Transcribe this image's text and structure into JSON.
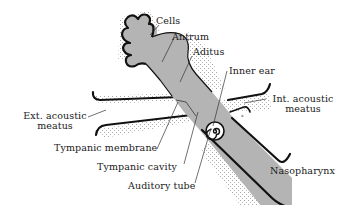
{
  "diagram": {
    "colors": {
      "tube_fill": "#b4b4b4",
      "outline": "#111111",
      "stipple": "#8a8a8a",
      "background": "#ffffff"
    },
    "labels": {
      "cells": "Cells",
      "antrum": "Antrum",
      "aditus": "Aditus",
      "inner_ear": "Inner ear",
      "int_acoustic_meatus_line1": "Int. acoustic",
      "int_acoustic_meatus_line2": "meatus",
      "ext_acoustic_meatus_line1": "Ext. acoustic",
      "ext_acoustic_meatus_line2": "meatus",
      "tympanic_membrane": "Tympanic membrane",
      "tympanic_cavity": "Tympanic cavity",
      "auditory_tube": "Auditory tube",
      "nasopharynx": "Nasopharynx"
    }
  }
}
